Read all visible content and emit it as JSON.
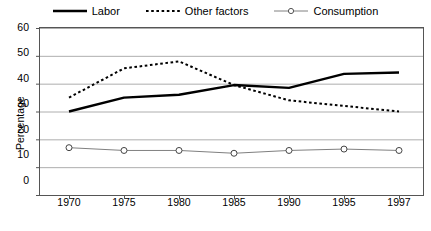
{
  "chart_data": {
    "type": "line",
    "title": "",
    "xlabel": "",
    "ylabel": "Percentage",
    "categories": [
      "1970",
      "1975",
      "1980",
      "1985",
      "1990",
      "1995",
      "1997"
    ],
    "ylim": [
      0,
      60
    ],
    "yticks": [
      "0",
      "10",
      "20",
      "30",
      "40",
      "50",
      "60"
    ],
    "grid": "horizontal",
    "legend_position": "top-center",
    "series": [
      {
        "name": "Labor",
        "style": "solid",
        "marker": "none",
        "color": "#000000",
        "values": [
          30,
          35,
          36,
          39.5,
          38.5,
          43.5,
          44
        ]
      },
      {
        "name": "Other factors",
        "style": "dotted",
        "marker": "none",
        "color": "#000000",
        "values": [
          35,
          45.5,
          48,
          39.5,
          34,
          32,
          30
        ]
      },
      {
        "name": "Consumption",
        "style": "solid-thin",
        "marker": "open-circle",
        "color": "#808080",
        "values": [
          17,
          16,
          16,
          15,
          16,
          16.5,
          16
        ]
      }
    ]
  },
  "legend": {
    "items": [
      {
        "label": "Labor",
        "icon": "solid-line-swatch"
      },
      {
        "label": "Other factors",
        "icon": "dotted-line-swatch"
      },
      {
        "label": "Consumption",
        "icon": "circle-marker-line-swatch"
      }
    ]
  },
  "axes": {
    "y_title": "Percentage",
    "y_ticks": [
      "60",
      "50",
      "40",
      "30",
      "20",
      "10",
      "0"
    ],
    "x_ticks": [
      "1970",
      "1975",
      "1980",
      "1985",
      "1990",
      "1995",
      "1997"
    ]
  },
  "colors": {
    "plot_border": "#555555",
    "gridline": "#999999",
    "series_primary": "#000000",
    "series_consumption": "#808080",
    "background": "#ffffff"
  }
}
